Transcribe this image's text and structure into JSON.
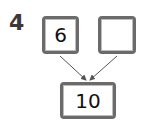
{
  "question": {
    "number": "4"
  },
  "number_bond": {
    "part_left": "6",
    "part_right": "",
    "whole": "10"
  },
  "colors": {
    "box_border": "#6b6b6b",
    "arrow": "#555555",
    "text": "#111111"
  }
}
